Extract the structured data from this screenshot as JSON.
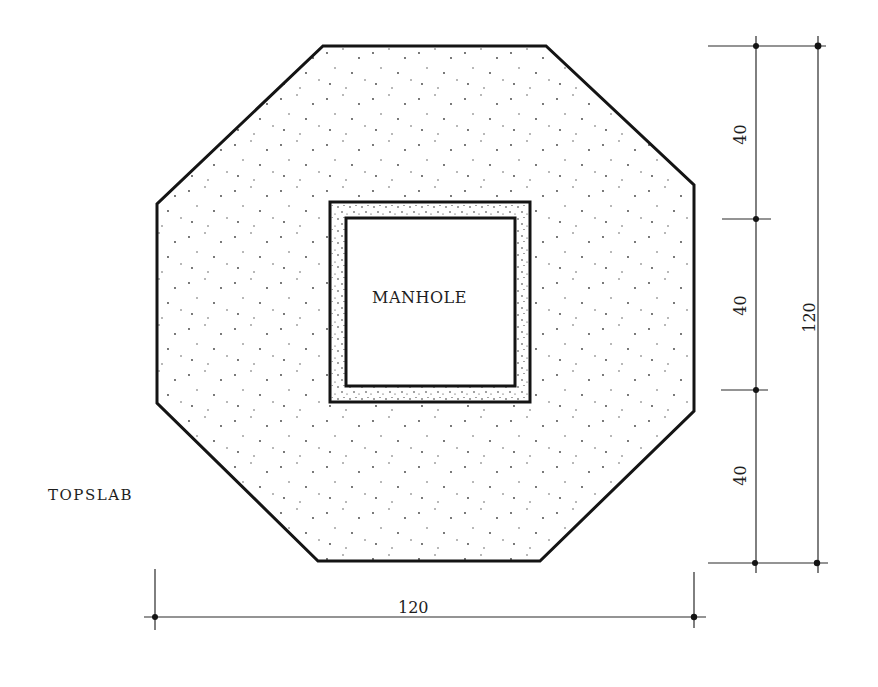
{
  "drawing": {
    "type": "plan view technical drawing",
    "labels": {
      "manhole": "MANHOLE",
      "topslab": "TOPSLAB"
    },
    "dimensions": {
      "horizontal_total": "120",
      "vertical_segments": [
        "40",
        "40",
        "40"
      ],
      "vertical_total": "120"
    },
    "colors": {
      "line": "#141414",
      "fill": "#ffffff",
      "stipple": "#3a3a3a"
    }
  }
}
